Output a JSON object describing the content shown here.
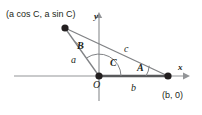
{
  "figure": {
    "colors": {
      "stroke": "#808285",
      "axis": "#939598",
      "point": "#231f20",
      "text": "#231f20",
      "base_highlight": "#58595b",
      "background": "#ffffff"
    },
    "axes": {
      "x_label": "x",
      "y_label": "y"
    },
    "points": [
      {
        "name": "vertex-top-left",
        "label": "(a cos C, a sin C)",
        "label_parts": [
          "(",
          "a",
          " cos ",
          "C",
          ", ",
          "a",
          " sin ",
          "C",
          ")"
        ],
        "x": 65,
        "y": 28
      },
      {
        "name": "origin",
        "label": "O",
        "x": 99,
        "y": 76
      },
      {
        "name": "vertex-right",
        "label": "(b, 0)",
        "x": 168,
        "y": 76
      }
    ],
    "sides": [
      {
        "name": "side-a",
        "label": "a"
      },
      {
        "name": "side-b",
        "label": "b"
      },
      {
        "name": "side-c",
        "label": "c"
      }
    ],
    "angles": [
      {
        "name": "angle-A",
        "label": "A"
      },
      {
        "name": "angle-B",
        "label": "B"
      },
      {
        "name": "angle-C",
        "label": "C"
      }
    ]
  }
}
